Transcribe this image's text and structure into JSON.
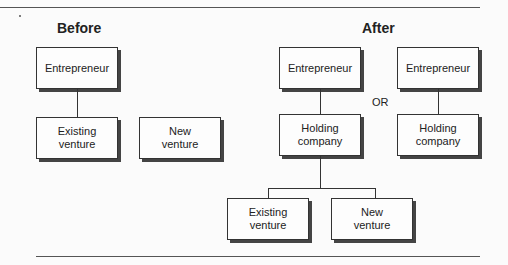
{
  "diagram": {
    "before": {
      "heading": "Before",
      "boxes": {
        "entrepreneur": "Entrepreneur",
        "existing": "Existing\nventure",
        "new": "New\nventure"
      }
    },
    "after": {
      "heading": "After",
      "or_label": "OR",
      "option1": {
        "entrepreneur": "Entrepreneur",
        "holding": "Holding\ncompany",
        "existing": "Existing\nventure",
        "new": "New\nventure"
      },
      "option2": {
        "entrepreneur": "Entrepreneur",
        "holding": "Holding\ncompany"
      }
    }
  }
}
